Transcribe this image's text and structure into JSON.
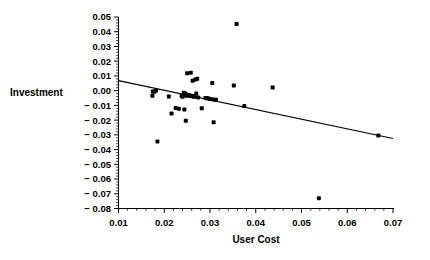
{
  "chart_data": {
    "type": "scatter",
    "title": "",
    "xlabel": "User  Cost",
    "ylabel": "Investment",
    "xlim": [
      0.01,
      0.07
    ],
    "ylim": [
      -0.08,
      0.05
    ],
    "grid": false,
    "legend": null,
    "x_ticks": [
      0.01,
      0.02,
      0.03,
      0.04,
      0.05,
      0.06,
      0.07
    ],
    "x_tick_labels": [
      "0.01",
      "0.02",
      "0.03",
      "0.04",
      "0.05",
      "0.06",
      "0.07"
    ],
    "y_ticks": [
      0.05,
      0.04,
      0.03,
      0.02,
      0.01,
      0.0,
      -0.01,
      -0.02,
      -0.03,
      -0.04,
      -0.05,
      -0.06,
      -0.07,
      -0.08
    ],
    "y_tick_labels": [
      "0.05",
      "0.04",
      "0.03",
      "0.02",
      "0.01",
      "0.00",
      "− 0.01",
      "− 0.02",
      "− 0.03",
      "− 0.04",
      "− 0.05",
      "− 0.06",
      "− 0.07",
      "− 0.08"
    ],
    "x_minor_tick_step": 0.002,
    "y_minor_tick_step": 0.002,
    "marker_color": "#000000",
    "marker_size": 3.0,
    "series": [
      {
        "name": "observations",
        "points": [
          [
            0.0175,
            -0.0005
          ],
          [
            0.0179,
            -0.0007
          ],
          [
            0.0182,
            0.0001
          ],
          [
            0.0174,
            -0.0035
          ],
          [
            0.0185,
            -0.0345
          ],
          [
            0.021,
            -0.004
          ],
          [
            0.0216,
            -0.0155
          ],
          [
            0.0225,
            -0.0118
          ],
          [
            0.0238,
            -0.0035
          ],
          [
            0.024,
            -0.0042
          ],
          [
            0.0243,
            -0.0015
          ],
          [
            0.0246,
            -0.002
          ],
          [
            0.0248,
            -0.0035
          ],
          [
            0.025,
            -0.0028
          ],
          [
            0.0252,
            -0.0032
          ],
          [
            0.0254,
            -0.003
          ],
          [
            0.0256,
            -0.0035
          ],
          [
            0.0258,
            -0.0034
          ],
          [
            0.026,
            -0.0036
          ],
          [
            0.0262,
            -0.0038
          ],
          [
            0.0264,
            -0.0038
          ],
          [
            0.025,
            0.0118
          ],
          [
            0.0258,
            0.0122
          ],
          [
            0.0262,
            0.0068
          ],
          [
            0.0272,
            0.008
          ],
          [
            0.0268,
            0.0075
          ],
          [
            0.0232,
            -0.0122
          ],
          [
            0.0244,
            -0.0128
          ],
          [
            0.0247,
            -0.0205
          ],
          [
            0.0266,
            -0.0042
          ],
          [
            0.027,
            -0.002
          ],
          [
            0.0274,
            -0.0046
          ],
          [
            0.0282,
            -0.012
          ],
          [
            0.029,
            -0.005
          ],
          [
            0.0293,
            -0.0052
          ],
          [
            0.0295,
            -0.0051
          ],
          [
            0.03,
            -0.0056
          ],
          [
            0.0307,
            -0.006
          ],
          [
            0.0313,
            -0.0062
          ],
          [
            0.0305,
            0.0052
          ],
          [
            0.0308,
            -0.0215
          ],
          [
            0.0358,
            0.0452
          ],
          [
            0.0352,
            0.0035
          ],
          [
            0.0375,
            -0.0105
          ],
          [
            0.0437,
            0.0022
          ],
          [
            0.0538,
            -0.073
          ],
          [
            0.0668,
            -0.0305
          ]
        ]
      }
    ],
    "fit_line": {
      "name": "regression-line",
      "x_start": 0.01,
      "y_start": 0.0068,
      "x_end": 0.07,
      "y_end": -0.0325,
      "color": "#000000"
    }
  }
}
